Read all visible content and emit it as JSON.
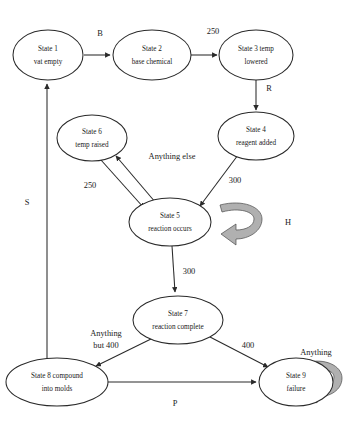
{
  "diagram": {
    "type": "state-machine",
    "background_color": "#ffffff",
    "line_color": "#2a2a2a",
    "loop_fill_color": "#b0b0b0",
    "nodes": [
      {
        "id": "state1",
        "line1": "State 1",
        "line2": "vat empty",
        "cx": 48,
        "cy": 55,
        "rx": 35,
        "ry": 25
      },
      {
        "id": "state2",
        "line1": "State 2",
        "line2": "base chemical",
        "cx": 152,
        "cy": 55,
        "rx": 38,
        "ry": 25
      },
      {
        "id": "state3",
        "line1": "State 3 temp",
        "line2": "lowered",
        "cx": 256,
        "cy": 55,
        "rx": 36,
        "ry": 25
      },
      {
        "id": "state4",
        "line1": "State 4",
        "line2": "reagent added",
        "cx": 256,
        "cy": 136,
        "rx": 37,
        "ry": 24
      },
      {
        "id": "state5",
        "line1": "State 5",
        "line2": "reaction occurs",
        "cx": 170,
        "cy": 222,
        "rx": 40,
        "ry": 24
      },
      {
        "id": "state6",
        "line1": "State 6",
        "line2": "temp raised",
        "cx": 92,
        "cy": 138,
        "rx": 34,
        "ry": 23
      },
      {
        "id": "state7",
        "line1": "State 7",
        "line2": "reaction complete",
        "cx": 178,
        "cy": 320,
        "rx": 44,
        "ry": 24
      },
      {
        "id": "state8",
        "line1": "State 8 compound",
        "line2": "into molds",
        "cx": 57,
        "cy": 382,
        "rx": 50,
        "ry": 24
      },
      {
        "id": "state9",
        "line1": "State 9",
        "line2": "failure",
        "cx": 296,
        "cy": 382,
        "rx": 36,
        "ry": 24
      }
    ],
    "edges": [
      {
        "id": "e1",
        "from": "state1",
        "to": "state2",
        "label": "B",
        "lx": 100,
        "ly": 34
      },
      {
        "id": "e2",
        "from": "state2",
        "to": "state3",
        "label": "250",
        "lx": 213,
        "ly": 32
      },
      {
        "id": "e3",
        "from": "state3",
        "to": "state4",
        "label": "R",
        "lx": 269,
        "ly": 89
      },
      {
        "id": "e4",
        "from": "state4",
        "to": "state5",
        "label": "300",
        "lx": 235,
        "ly": 181
      },
      {
        "id": "e5",
        "from": "state6",
        "to": "state5",
        "label": "250",
        "lx": 90,
        "ly": 186
      },
      {
        "id": "e6",
        "from": "state5",
        "to": "state6",
        "label": "Anything else",
        "lx": 170,
        "ly": 157
      },
      {
        "id": "e7",
        "from": "state5",
        "to": "state7",
        "label": "300",
        "lx": 187,
        "ly": 272
      },
      {
        "id": "e8",
        "from": "state7",
        "to": "state8",
        "label_line1": "Anything",
        "label_line2": "but 400",
        "lx": 106,
        "ly": 334
      },
      {
        "id": "e9",
        "from": "state7",
        "to": "state9",
        "label": "400",
        "lx": 248,
        "ly": 346
      },
      {
        "id": "e10",
        "from": "state8",
        "to": "state9",
        "label": "P",
        "lx": 175,
        "ly": 404
      },
      {
        "id": "e11",
        "from": "state8",
        "to": "state1",
        "label": "S",
        "lx": 27,
        "ly": 203
      }
    ],
    "self_loops": [
      {
        "id": "loop5",
        "on": "state5",
        "label": "H",
        "lx": 288,
        "ly": 223
      },
      {
        "id": "loop9",
        "on": "state9",
        "label": "Anything",
        "lx": 318,
        "ly": 353
      }
    ]
  }
}
